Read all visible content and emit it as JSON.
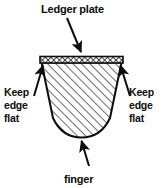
{
  "figure": {
    "background_color": "#ffffff",
    "line_color": "#0d0d0d",
    "hatch_color": "#4d4d4d"
  },
  "labels": {
    "top": "Ledger plate",
    "left_line1": "Keep",
    "left_line2": "edge",
    "left_line3": "flat",
    "right_line1": "Keep",
    "right_line2": "edge",
    "right_line3": "flat",
    "bottom": "finger"
  },
  "annotations": [
    {
      "name": "ledger-plate",
      "label": "Ledger plate",
      "arrow_direction": "down-right",
      "points_to": "top cross-hatched plate band"
    },
    {
      "name": "keep-edge-flat-left",
      "label": "Keep edge flat",
      "arrow_direction": "up-right",
      "points_to": "left top corner of finger"
    },
    {
      "name": "keep-edge-flat-right",
      "label": "Keep edge flat",
      "arrow_direction": "up-left",
      "points_to": "right top corner of finger"
    },
    {
      "name": "finger",
      "label": "finger",
      "arrow_direction": "up",
      "points_to": "rounded bottom of finger body"
    }
  ],
  "shapes": {
    "ledger_plate": {
      "name": "ledger-plate-band",
      "fill": "cross-hatch",
      "description": "thin horizontal cross-hatched band across the top"
    },
    "finger_body": {
      "name": "finger-body",
      "fill": "diagonal-hatch-45",
      "description": "tapered bucket shape with rounded bottom"
    }
  }
}
